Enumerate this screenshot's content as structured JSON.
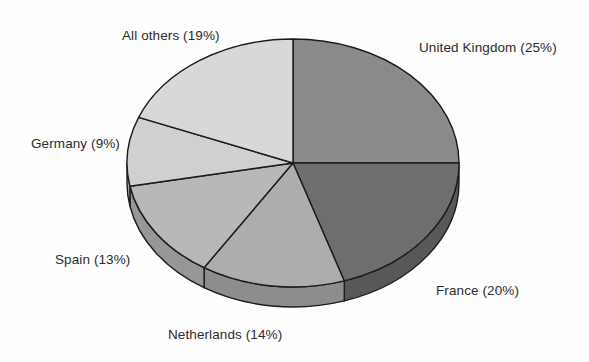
{
  "chart_data": {
    "type": "pie",
    "title": "",
    "subtitle": "",
    "xlabel": "",
    "ylabel": "",
    "legend_position": "none",
    "grid": false,
    "style": "3d-exploded-none",
    "value_unit": "%",
    "start_angle_deg": 0,
    "direction": "clockwise",
    "categories": [
      "United Kingdom",
      "France",
      "Netherlands",
      "Spain",
      "Germany",
      "All others"
    ],
    "values": [
      25,
      20,
      14,
      13,
      9,
      19
    ],
    "labels": [
      "United Kingdom (25%)",
      "France (20%)",
      "Netherlands (14%)",
      "Spain (13%)",
      "Germany (9%)",
      "All others (19%)"
    ],
    "colors": [
      "#8a8a8a",
      "#6e6e6e",
      "#adadad",
      "#b8b8b8",
      "#d0d0d0",
      "#d8d8d8"
    ],
    "side_colors": [
      "#6f6f6f",
      "#585858",
      "#8d8d8d",
      "#979797",
      "#adadad",
      "#b4b4b4"
    ],
    "slices": [
      {
        "name": "United Kingdom",
        "value": 25,
        "label": "United Kingdom (25%)",
        "color": "#8a8a8a"
      },
      {
        "name": "France",
        "value": 20,
        "label": "France (20%)",
        "color": "#6e6e6e"
      },
      {
        "name": "Netherlands",
        "value": 14,
        "label": "Netherlands (14%)",
        "color": "#adadad"
      },
      {
        "name": "Spain",
        "value": 13,
        "label": "Spain (13%)",
        "color": "#b8b8b8"
      },
      {
        "name": "Germany",
        "value": 9,
        "label": "Germany (9%)",
        "color": "#d0d0d0"
      },
      {
        "name": "All others",
        "value": 19,
        "label": "All others (19%)",
        "color": "#d8d8d8"
      }
    ]
  },
  "geometry": {
    "cx": 293,
    "cy": 163,
    "rx": 166,
    "ry": 124,
    "depth": 20,
    "stroke": "#1b1b1b",
    "stroke_width": 1.4,
    "background": "#fefefe"
  }
}
